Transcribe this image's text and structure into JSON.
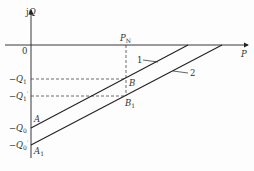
{
  "diagram": {
    "type": "P-Q characteristic (reactive power vs active power)",
    "axes": {
      "y_label": "jQ",
      "x_label": "P",
      "origin_label": "0"
    },
    "rated_point": {
      "label": "P",
      "subscript": "N"
    },
    "y_ticks": [
      {
        "id": "q1",
        "prefix": "−Q",
        "sub": "1",
        "prime": ""
      },
      {
        "id": "q1p",
        "prefix": "−Q",
        "sub": "1",
        "prime": "′"
      },
      {
        "id": "q0",
        "prefix": "−Q",
        "sub": "0",
        "prime": ""
      },
      {
        "id": "q0p",
        "prefix": "−Q",
        "sub": "0",
        "prime": "′"
      }
    ],
    "points": [
      {
        "id": "A",
        "label": "A",
        "sub": ""
      },
      {
        "id": "A1",
        "label": "A",
        "sub": "1"
      },
      {
        "id": "B",
        "label": "B",
        "sub": ""
      },
      {
        "id": "B1",
        "label": "B",
        "sub": "1"
      }
    ],
    "lines": [
      {
        "id": "line1",
        "label": "1",
        "from": "A",
        "through": "B"
      },
      {
        "id": "line2",
        "label": "2",
        "from": "A1",
        "through": "B1"
      }
    ],
    "colors": {
      "line": "#222222",
      "dashed": "#444444",
      "text": "#333333"
    }
  }
}
